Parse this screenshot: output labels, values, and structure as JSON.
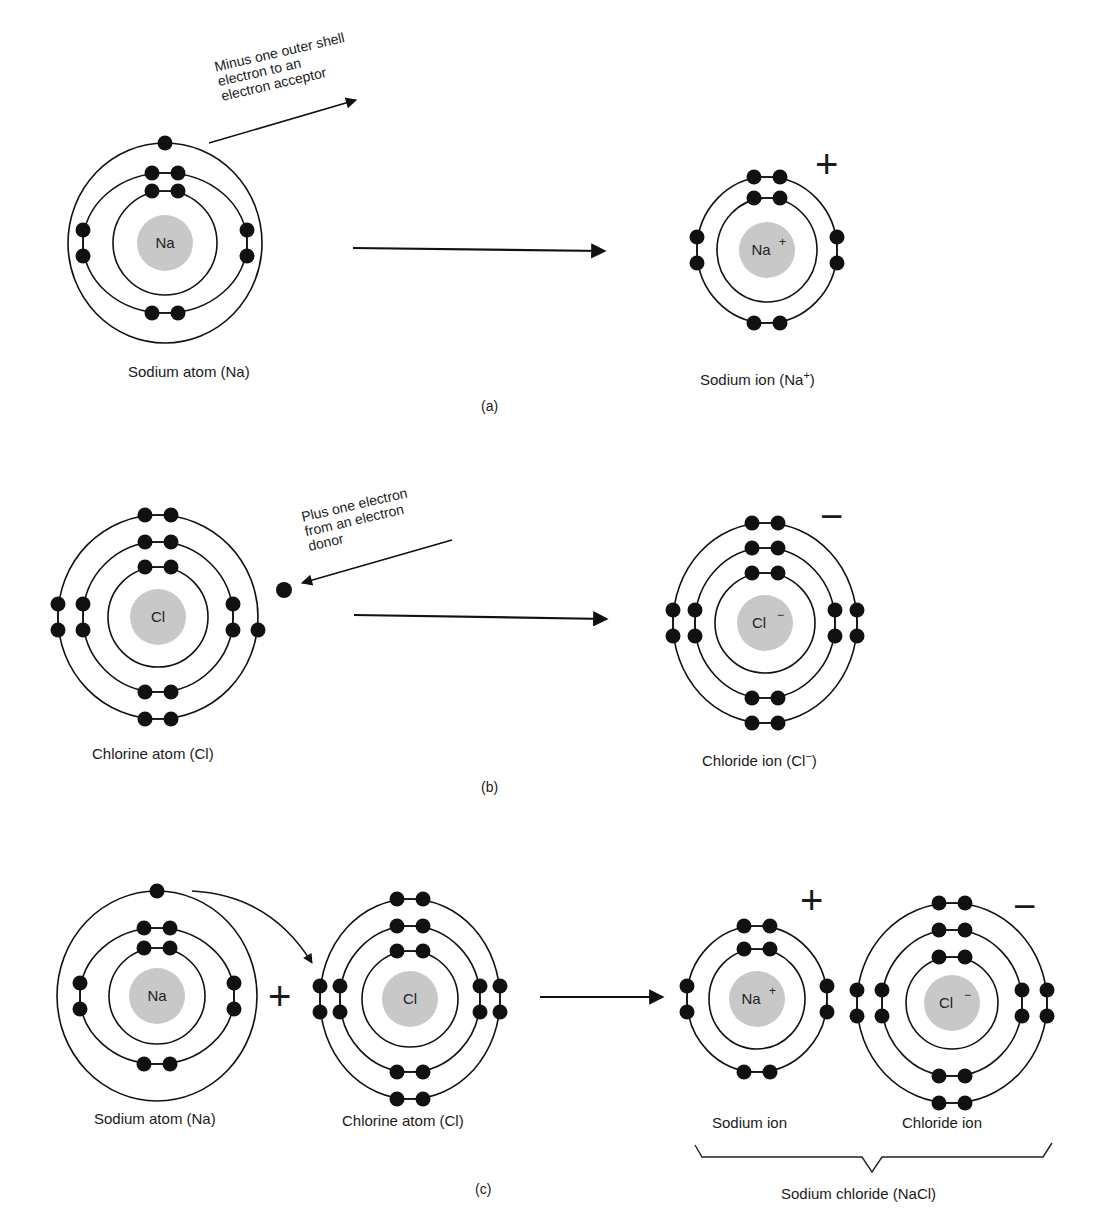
{
  "colors": {
    "ink": "#111111",
    "nucleus": "#c8c8c8",
    "background": "#ffffff"
  },
  "panels": {
    "a": {
      "caption": "(a)",
      "reactant": {
        "symbol": "Na",
        "label": "Sodium atom (Na)",
        "cx": 165,
        "cy": 243,
        "shells": [
          {
            "r": 52,
            "pairs": [
              "top"
            ]
          },
          {
            "r": 82,
            "pairs": [
              "top",
              "left",
              "right",
              "bottom"
            ]
          },
          {
            "r": 97,
            "singles": [
              "top"
            ]
          }
        ]
      },
      "product": {
        "symbol": "Na",
        "charge": "+",
        "label": "Sodium ion (Na",
        "label_charge": "+",
        "label_close": ")",
        "cx": 767,
        "cy": 250,
        "shells": [
          {
            "r": 52,
            "pairs": [
              "top"
            ]
          },
          {
            "r": 75,
            "pairs": [
              "top",
              "left",
              "right",
              "bottom"
            ]
          }
        ]
      },
      "annotation": [
        "Minus one outer shell",
        "electron to an",
        "electron acceptor"
      ],
      "ion_sign": "+"
    },
    "b": {
      "caption": "(b)",
      "reactant": {
        "symbol": "Cl",
        "label": "Chlorine atom (Cl)",
        "cx": 158,
        "cy": 617
      },
      "product": {
        "symbol": "Cl",
        "charge": "−",
        "label": "Chloride ion (Cl",
        "label_charge": "−",
        "label_close": ")",
        "cx": 765,
        "cy": 623
      },
      "annotation": [
        "Plus one electron",
        "from an electron",
        "donor"
      ],
      "ion_sign": "−"
    },
    "c": {
      "caption": "(c)",
      "items": [
        {
          "symbol": "Na",
          "label": "Sodium atom (Na)"
        },
        {
          "symbol": "Cl",
          "label": "Chlorine atom (Cl)"
        },
        {
          "symbol": "Na",
          "charge": "+",
          "label": "Sodium ion"
        },
        {
          "symbol": "Cl",
          "charge": "−",
          "label": "Chloride ion"
        }
      ],
      "plus_sign": "+",
      "ion_signs": [
        "+",
        "−"
      ],
      "compound_label": "Sodium chloride (NaCl)"
    }
  }
}
